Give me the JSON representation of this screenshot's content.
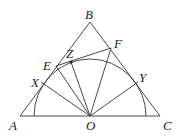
{
  "diagram": {
    "title": "",
    "points": {
      "A": {
        "label": "A",
        "x": 20,
        "y": 116
      },
      "B": {
        "label": "B",
        "x": 90,
        "y": 22
      },
      "C": {
        "label": "C",
        "x": 160,
        "y": 116
      },
      "O": {
        "label": "O",
        "x": 90,
        "y": 116
      },
      "E": {
        "label": "E",
        "x": 56,
        "y": 66
      },
      "F": {
        "label": "F",
        "x": 111,
        "y": 48
      },
      "X": {
        "label": "X",
        "x": 41,
        "y": 82
      },
      "Y": {
        "label": "Y",
        "x": 138,
        "y": 82
      },
      "Z": {
        "label": "Z",
        "x": 71,
        "y": 62
      }
    },
    "segments": [
      [
        "A",
        "B"
      ],
      [
        "B",
        "C"
      ],
      [
        "A",
        "C"
      ],
      [
        "E",
        "F"
      ],
      [
        "O",
        "X"
      ],
      [
        "O",
        "E"
      ],
      [
        "O",
        "Z"
      ],
      [
        "O",
        "F"
      ],
      [
        "O",
        "Y"
      ]
    ],
    "arc": {
      "center": "O",
      "radius": 57,
      "from_x": 34,
      "to_x": 146
    },
    "highlighted_point": "Z",
    "line_color": "#333333"
  }
}
